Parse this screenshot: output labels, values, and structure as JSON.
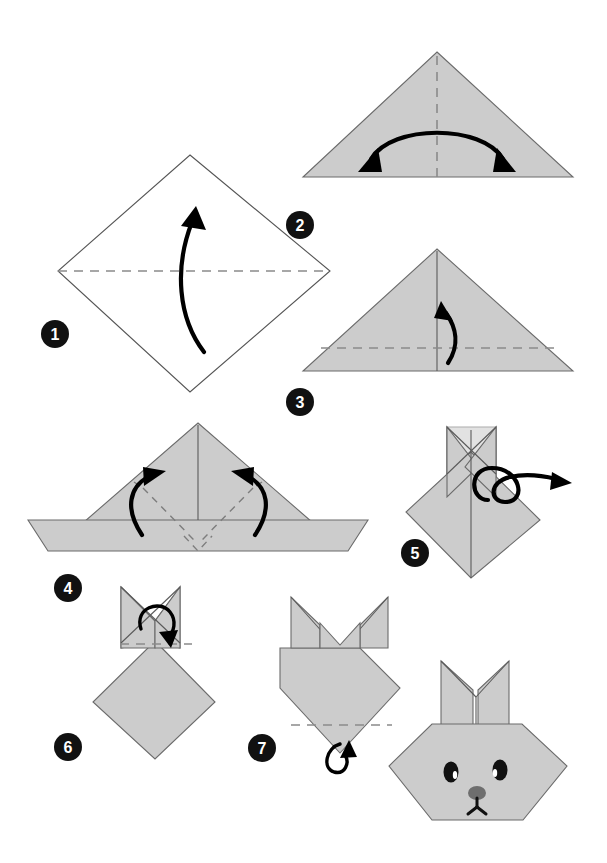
{
  "page": {
    "background_color": "#ffffff",
    "width": 607,
    "height": 863,
    "step_count": 8
  },
  "palette": {
    "paper_fill": "#cccccc",
    "paper_edge": "#6b6b6b",
    "paper_blank_fill": "#ffffff",
    "crease_dashed": "#8a8a8a",
    "crease_solid": "#5a5a5a",
    "arrow": "#000000",
    "badge_fill": "#111111",
    "badge_text": "#ffffff",
    "eye": "#111111",
    "nose": "#6e6e6e"
  },
  "steps": [
    {
      "number": "1",
      "badge_x": 55,
      "badge_y": 334,
      "shape": "square-rotated-diamond",
      "paper_state": "unfolded-white",
      "crease": "horizontal-dashed-valley",
      "arrow": "single-curved-up",
      "caption": ""
    },
    {
      "number": "2",
      "badge_x": 300,
      "badge_y": 225,
      "shape": "triangle",
      "paper_state": "folded-gray",
      "crease": "vertical-dashed-center",
      "arrow": "double-headed-curved",
      "caption": ""
    },
    {
      "number": "3",
      "badge_x": 300,
      "badge_y": 402,
      "shape": "triangle",
      "paper_state": "folded-gray",
      "crease": "horizontal-dashed-lower-plus-vertical-solid",
      "arrow": "single-curved-up",
      "caption": ""
    },
    {
      "number": "4",
      "badge_x": 68,
      "badge_y": 588,
      "shape": "triangle-with-bottom-band",
      "paper_state": "folded-gray",
      "crease": "two-diagonal-dashed-and-v-dashed",
      "arrow": "two-curved-inward",
      "caption": ""
    },
    {
      "number": "5",
      "badge_x": 415,
      "badge_y": 553,
      "shape": "diamond-with-crossed-ears",
      "paper_state": "folded-gray",
      "crease": "vertical-solid-center",
      "arrow": "flip-over-loop",
      "caption": ""
    },
    {
      "number": "6",
      "badge_x": 68,
      "badge_y": 747,
      "shape": "diamond-with-crossed-ears",
      "paper_state": "folded-gray",
      "crease": "horizontal-dashed-upper",
      "arrow": "small-loop-down",
      "caption": ""
    },
    {
      "number": "7",
      "badge_x": 262,
      "badge_y": 748,
      "shape": "pentagon-head-with-ears",
      "paper_state": "folded-gray",
      "crease": "horizontal-dashed-lower",
      "arrow": "small-loop-up",
      "caption": ""
    },
    {
      "number": "8",
      "badge_x": 0,
      "badge_y": 0,
      "badge_visible": false,
      "shape": "hexagon-bunny-face-with-ears",
      "paper_state": "finished-gray",
      "crease": "ear-base-line",
      "arrow": "none",
      "caption": ""
    }
  ],
  "final_figure": {
    "name": "bunny-face",
    "features": [
      "left-ear",
      "right-ear",
      "left-eye",
      "right-eye",
      "nose",
      "mouth"
    ],
    "eye_color": "#111111",
    "nose_color": "#6e6e6e"
  }
}
